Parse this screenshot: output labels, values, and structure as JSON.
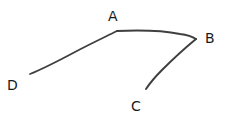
{
  "diagram": {
    "type": "labeled-polyline",
    "nodes": [
      {
        "id": "D",
        "label": "D"
      },
      {
        "id": "A",
        "label": "A"
      },
      {
        "id": "B",
        "label": "B"
      },
      {
        "id": "C",
        "label": "C"
      }
    ],
    "edges": [
      {
        "from": "D",
        "to": "A"
      },
      {
        "from": "A",
        "to": "B"
      },
      {
        "from": "B",
        "to": "C"
      }
    ],
    "path_order": [
      "D",
      "A",
      "B",
      "C"
    ],
    "colors": {
      "stroke": "#3f3f3f",
      "label": "#1a1a1a",
      "background": "#ffffff"
    }
  }
}
